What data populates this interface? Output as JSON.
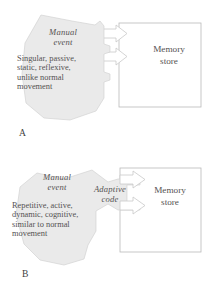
{
  "figure": {
    "type": "diagram",
    "colors": {
      "shape_fill": "#eaeaea",
      "shape_stroke": "#d2d2d2",
      "arrow_fill": "#ffffff",
      "arrow_stroke": "#c9c9c9",
      "box_stroke": "#b9b9b9",
      "text": "#555252",
      "background": "#ffffff"
    }
  },
  "panel_a": {
    "letter": "A",
    "shape_title": "Manual\nevent",
    "shape_title_line1": "Manual",
    "shape_title_line2": "event",
    "shape_text": "Singular, passive, static, reflexive, unlike normal movement",
    "shape_text_lines": [
      "Singular, passive,",
      "static, reflexive,",
      "unlike normal",
      "movement"
    ],
    "box_label": "Memory store",
    "box_label_line1": "Memory",
    "box_label_line2": "store",
    "arrow_count": 2,
    "arrow_direction": "right"
  },
  "panel_b": {
    "letter": "B",
    "shape_title": "Manual\nevent",
    "shape_title_line1": "Manual",
    "shape_title_line2": "event",
    "shape_text": "Repetitive, active, dynamic, cognitive, similar to normal movement",
    "shape_text_lines": [
      "Repetitive, active,",
      "dynamic, cognitive,",
      "similar to normal",
      "movement"
    ],
    "adaptive_label": "Adaptive code",
    "adaptive_label_line1": "Adaptive",
    "adaptive_label_line2": "code",
    "box_label": "Memory store",
    "box_label_line1": "Memory",
    "box_label_line2": "store",
    "arrow_count": 2,
    "arrow_direction": "right"
  }
}
